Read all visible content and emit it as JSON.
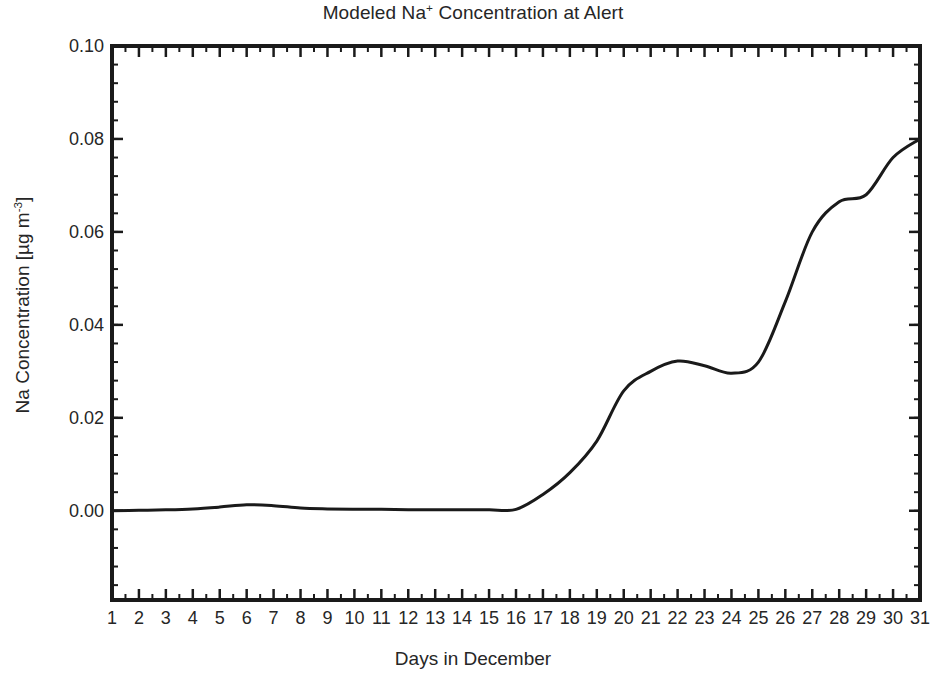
{
  "chart_data": {
    "type": "line",
    "title": "Modeled Na+ Concentration at Alert",
    "title_main": "Modeled Na",
    "title_sup": "+",
    "title_rest": " Concentration at Alert",
    "xlabel": "Days in December",
    "ylabel": "Na Concentration [µg m⁻³]",
    "ylabel_main": "Na Concentration [µg m",
    "ylabel_sup": "-3",
    "ylabel_tail": "]",
    "grid": false,
    "legend": "none",
    "line_color": "#1a1a1a",
    "line_width": 3,
    "background": "#ffffff",
    "axis_color": "#1a1a1a",
    "xlim": [
      1,
      31
    ],
    "ylim": [
      -0.0192,
      0.1
    ],
    "yticks": [
      0.0,
      0.02,
      0.04,
      0.06,
      0.08,
      0.1
    ],
    "ytick_labels": [
      "0.00",
      "0.02",
      "0.04",
      "0.06",
      "0.08",
      "0.10"
    ],
    "y_minor_step": 0.004,
    "xticks": [
      1,
      2,
      3,
      4,
      5,
      6,
      7,
      8,
      9,
      10,
      11,
      12,
      13,
      14,
      15,
      16,
      17,
      18,
      19,
      20,
      21,
      22,
      23,
      24,
      25,
      26,
      27,
      28,
      29,
      30,
      31
    ],
    "xtick_labels": [
      "1",
      "2",
      "3",
      "4",
      "5",
      "6",
      "7",
      "8",
      "9",
      "10",
      "11",
      "12",
      "13",
      "14",
      "15",
      "16",
      "17",
      "18",
      "19",
      "20",
      "21",
      "22",
      "23",
      "24",
      "25",
      "26",
      "27",
      "28",
      "29",
      "30",
      "31"
    ],
    "x": [
      1,
      2,
      3,
      4,
      5,
      6,
      7,
      8,
      9,
      10,
      11,
      12,
      13,
      14,
      15,
      16,
      17,
      18,
      19,
      20,
      21,
      22,
      23,
      24,
      25,
      26,
      27,
      28,
      29,
      30,
      31
    ],
    "values": [
      0.0,
      0.0001,
      0.0002,
      0.0004,
      0.0008,
      0.0013,
      0.0011,
      0.0006,
      0.0004,
      0.0003,
      0.0003,
      0.0002,
      0.0002,
      0.0002,
      0.0002,
      0.0003,
      0.0035,
      0.0082,
      0.015,
      0.0258,
      0.03,
      0.0322,
      0.0312,
      0.0296,
      0.032,
      0.045,
      0.06,
      0.0665,
      0.068,
      0.076,
      0.08
    ],
    "series": [
      {
        "name": "Modeled Na+ concentration",
        "values": [
          0.0,
          0.0001,
          0.0002,
          0.0004,
          0.0008,
          0.0013,
          0.0011,
          0.0006,
          0.0004,
          0.0003,
          0.0003,
          0.0002,
          0.0002,
          0.0002,
          0.0002,
          0.0003,
          0.0035,
          0.0082,
          0.015,
          0.0258,
          0.03,
          0.0322,
          0.0312,
          0.0296,
          0.032,
          0.045,
          0.06,
          0.0665,
          0.068,
          0.076,
          0.08
        ]
      }
    ]
  }
}
